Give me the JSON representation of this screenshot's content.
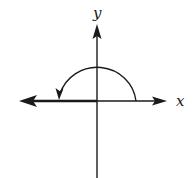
{
  "diagram": {
    "type": "angle-in-standard-position",
    "axes": {
      "x_label": "x",
      "y_label": "y"
    },
    "angle": {
      "initial_side": "positive x-axis",
      "terminal_side": "negative x-axis",
      "rotation": "counterclockwise",
      "measure_degrees": 180
    },
    "colors": {
      "stroke": "#1a1a1a",
      "background": "#ffffff"
    }
  }
}
